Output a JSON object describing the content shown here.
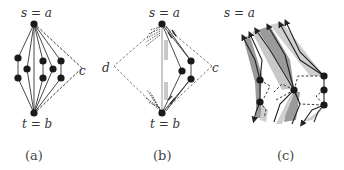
{
  "panels": [
    {
      "id": "a",
      "caption": "(a)",
      "top_label": "s = a",
      "bottom_label": "t = b",
      "side_label_right": "c"
    },
    {
      "id": "b",
      "caption": "(b)",
      "top_label": "s = a",
      "bottom_label": "t = b",
      "side_label_left": "d",
      "side_label_right": "c"
    },
    {
      "id": "c",
      "caption": "(c)",
      "top_label": "s = a"
    }
  ],
  "colors": {
    "node": "#1a1a1a",
    "edge": "#333333",
    "dashed": "#555555",
    "shade_dark": "#9a9a9a",
    "shade_light": "#cfcfcf"
  }
}
